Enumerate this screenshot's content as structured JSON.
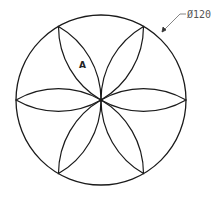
{
  "drawing": {
    "type": "technical-drawing",
    "subject": "six-petal rosette inscribed in circle",
    "circle": {
      "cx": 101,
      "cy": 100,
      "r": 85
    },
    "petal_count": 6,
    "stroke_color": "#1a1a1a",
    "dimension": {
      "label": "Ø120",
      "color": "#555555"
    },
    "region_label": "A"
  }
}
